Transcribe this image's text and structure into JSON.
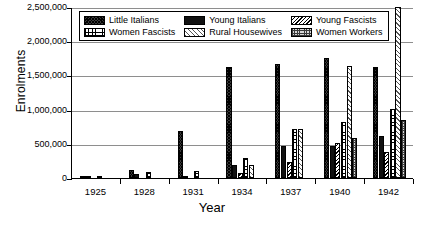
{
  "chart_data": {
    "type": "bar",
    "title": "",
    "xlabel": "Year",
    "ylabel": "Enrolments",
    "categories": [
      "1925",
      "1928",
      "1931",
      "1934",
      "1937",
      "1940",
      "1942"
    ],
    "ylim": [
      0,
      2500000
    ],
    "ytick_values": [
      0,
      500000,
      1000000,
      1500000,
      2000000,
      2500000
    ],
    "ytick_labels": [
      "0",
      "500,000",
      "1,000,000",
      "1,500,000",
      "2,000,000",
      "2,500,000"
    ],
    "grid": true,
    "legend_position": "top-center-inside",
    "series": [
      {
        "name": "Little Italians",
        "pattern": "p-little",
        "values": [
          18000,
          115000,
          685000,
          1625000,
          1665000,
          1750000,
          1620000
        ]
      },
      {
        "name": "Young Italians",
        "pattern": "p-young",
        "values": [
          6000,
          58000,
          24000,
          185000,
          475000,
          470000,
          620000
        ]
      },
      {
        "name": "Young Fascists",
        "pattern": "p-yfasc",
        "values": [
          0,
          0,
          0,
          70000,
          235000,
          505000,
          375000
        ]
      },
      {
        "name": "Women Fascists",
        "pattern": "p-wfasc",
        "values": [
          14000,
          82000,
          105000,
          290000,
          715000,
          825000,
          1005000
        ]
      },
      {
        "name": "Rural Housewives",
        "pattern": "p-rural",
        "values": [
          0,
          0,
          0,
          185000,
          715000,
          1635000,
          2500000
        ]
      },
      {
        "name": "Women Workers",
        "pattern": "p-wwork",
        "values": [
          0,
          0,
          0,
          0,
          0,
          590000,
          845000
        ]
      }
    ]
  }
}
